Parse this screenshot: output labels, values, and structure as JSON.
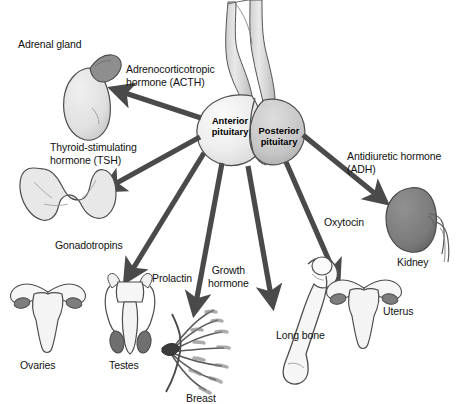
{
  "diagram": {
    "background_color": "#ffffff",
    "arrow_color": "#4a4a4a",
    "outline_color": "#3a3a3a"
  },
  "gland": {
    "anterior_label": "Anterior\npituitary",
    "posterior_label": "Posterior\npituitary",
    "anterior_fill": "#ebebeb",
    "posterior_fill": "#c9c9c9",
    "stalk_fill": "#dcdcdc"
  },
  "hormones": [
    {
      "id": "acth",
      "label": "Adrenocorticotropic\nhormone (ACTH)",
      "target": "adrenal-gland"
    },
    {
      "id": "tsh",
      "label": "Thyroid-stimulating\nhormone (TSH)",
      "target": "thyroid-gland"
    },
    {
      "id": "gonadotropins",
      "label": "Gonadotropins",
      "target": "gonads"
    },
    {
      "id": "prolactin",
      "label": "Prolactin",
      "target": "breast"
    },
    {
      "id": "growth-hormone",
      "label": "Growth\nhormone",
      "target": "long-bone"
    },
    {
      "id": "oxytocin",
      "label": "Oxytocin",
      "target": "uterus"
    },
    {
      "id": "adh",
      "label": "Antidiuretic hormone\n(ADH)",
      "target": "kidney"
    }
  ],
  "organs": [
    {
      "id": "adrenal-gland",
      "label": "Adrenal gland",
      "fill": "#e2e2e2",
      "cap_fill": "#8e8e8e"
    },
    {
      "id": "thyroid-gland",
      "label": "",
      "fill": "#e8e8e8"
    },
    {
      "id": "ovaries",
      "label": "Ovaries",
      "fill": "#f2f2f2",
      "accent_fill": "#7d7d7d"
    },
    {
      "id": "testes",
      "label": "Testes",
      "fill": "#f0f0f0",
      "accent_fill": "#6f6f6f"
    },
    {
      "id": "breast",
      "label": "Breast",
      "fill": "#9a9a9a"
    },
    {
      "id": "long-bone",
      "label": "Long bone",
      "fill": "#f4f4f4"
    },
    {
      "id": "uterus",
      "label": "Uterus",
      "fill": "#f2f2f2",
      "accent_fill": "#7d7d7d"
    },
    {
      "id": "kidney",
      "label": "Kidney",
      "fill": "#7c7c7c"
    }
  ],
  "labels": {
    "adrenal_gland": "Adrenal gland",
    "acth": "Adrenocorticotropic\nhormone (ACTH)",
    "tsh": "Thyroid-stimulating\nhormone (TSH)",
    "gonadotropins": "Gonadotropins",
    "prolactin": "Prolactin",
    "growth_hormone": "Growth\nhormone",
    "oxytocin": "Oxytocin",
    "adh": "Antidiuretic hormone\n(ADH)",
    "ovaries": "Ovaries",
    "testes": "Testes",
    "breast": "Breast",
    "long_bone": "Long bone",
    "uterus": "Uterus",
    "kidney": "Kidney",
    "anterior_pituitary": "Anterior\npituitary",
    "posterior_pituitary": "Posterior\npituitary"
  }
}
